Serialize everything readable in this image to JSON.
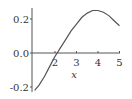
{
  "chart_data": {
    "type": "line",
    "title": "",
    "xlabel": "x",
    "ylabel": "",
    "xlim": [
      1,
      5
    ],
    "ylim": [
      -0.22,
      0.26
    ],
    "grid": false,
    "legend": null,
    "x_ticks": [
      "2",
      "3",
      "4",
      "5"
    ],
    "y_ticks": [
      "0.2",
      "0.0",
      "-0.2"
    ],
    "series": [
      {
        "name": "f(x)",
        "color": "#555555",
        "x": [
          1.05,
          1.25,
          1.5,
          1.75,
          2.0,
          2.1,
          2.25,
          2.5,
          2.75,
          3.0,
          3.25,
          3.5,
          3.75,
          4.0,
          4.25,
          4.5,
          4.75,
          5.0
        ],
        "y": [
          -0.22,
          -0.19,
          -0.14,
          -0.08,
          -0.02,
          0.0,
          0.03,
          0.08,
          0.13,
          0.17,
          0.21,
          0.235,
          0.25,
          0.25,
          0.24,
          0.22,
          0.19,
          0.16
        ]
      }
    ]
  }
}
